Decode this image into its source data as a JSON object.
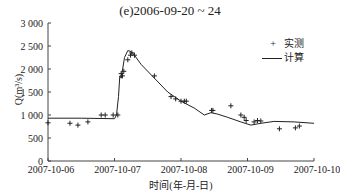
{
  "chart_data": {
    "type": "line",
    "title": "(e)2006-09-20 ~ 24",
    "xlabel": "时间(年-月-日)",
    "ylabel": "Q(m³/s)",
    "ylim": [
      0,
      3000
    ],
    "yticks": [
      "0",
      "500",
      "1 000",
      "1 500",
      "2 000",
      "2 500",
      "3 000"
    ],
    "xticks": [
      "2007-10-06",
      "2007-10-07",
      "2007-10-08",
      "2007-10-09",
      "2007-10-10"
    ],
    "xlim_days": [
      0,
      4
    ],
    "grid": false,
    "legend_position": "upper right",
    "series": [
      {
        "name": "实测",
        "marker": "+",
        "x_days": [
          0.0,
          0.33,
          0.45,
          0.6,
          0.8,
          0.86,
          0.98,
          1.05,
          1.1,
          1.12,
          1.14,
          1.2,
          1.24,
          1.26,
          1.3,
          1.6,
          1.85,
          1.92,
          2.0,
          2.05,
          2.08,
          2.46,
          2.48,
          2.75,
          2.9,
          2.95,
          2.98,
          3.1,
          3.15,
          3.2,
          3.48,
          3.72,
          3.78
        ],
        "values": [
          830,
          820,
          780,
          850,
          1000,
          1000,
          1000,
          1000,
          1900,
          1850,
          1950,
          2200,
          2300,
          2350,
          2300,
          1850,
          1400,
          1350,
          1300,
          1300,
          1300,
          1100,
          1100,
          1200,
          1000,
          950,
          880,
          850,
          880,
          870,
          700,
          720,
          760
        ]
      },
      {
        "name": "计算",
        "marker": "line",
        "x_days": [
          0,
          0.5,
          1.0,
          1.03,
          1.06,
          1.08,
          1.1,
          1.15,
          1.2,
          1.25,
          1.3,
          1.4,
          1.6,
          1.8,
          2.0,
          2.2,
          2.35,
          2.45,
          2.55,
          2.7,
          2.9,
          3.05,
          3.2,
          3.4,
          3.7,
          4.0
        ],
        "values": [
          930,
          930,
          920,
          1000,
          1400,
          1850,
          1800,
          2250,
          2400,
          2380,
          2300,
          2100,
          1800,
          1500,
          1300,
          1150,
          1000,
          1050,
          1020,
          950,
          850,
          780,
          820,
          860,
          850,
          820
        ]
      }
    ]
  },
  "legend": {
    "observed_marker": "+",
    "observed_label": "实测",
    "computed_label": "计算"
  }
}
